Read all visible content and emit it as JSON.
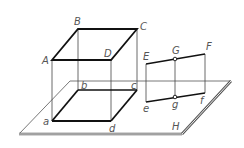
{
  "diagram": {
    "colors": {
      "thick_line": "#111111",
      "thin_line": "#444444",
      "plane_edge": "#555555",
      "label": "#555555",
      "background": "#ffffff"
    },
    "labels": {
      "A": "A",
      "B": "B",
      "C": "C",
      "D": "D",
      "a": "a",
      "b": "b",
      "c": "c",
      "d": "d",
      "E": "E",
      "F": "F",
      "G": "G",
      "e": "e",
      "f": "f",
      "g": "g",
      "H": "H"
    },
    "points": {
      "A": [
        52,
        60
      ],
      "B": [
        78,
        29
      ],
      "C": [
        137,
        29
      ],
      "D": [
        111,
        60
      ],
      "a": [
        52,
        121
      ],
      "b": [
        78,
        90
      ],
      "c": [
        137,
        90
      ],
      "d": [
        111,
        121
      ],
      "E": [
        146,
        64
      ],
      "G": [
        175,
        59
      ],
      "F": [
        205,
        54
      ],
      "e": [
        146,
        102
      ],
      "g": [
        175,
        97
      ],
      "f": [
        205,
        93
      ]
    },
    "plane_H": [
      [
        70,
        81
      ],
      [
        231,
        81
      ],
      [
        182,
        134
      ],
      [
        19,
        134
      ]
    ]
  }
}
